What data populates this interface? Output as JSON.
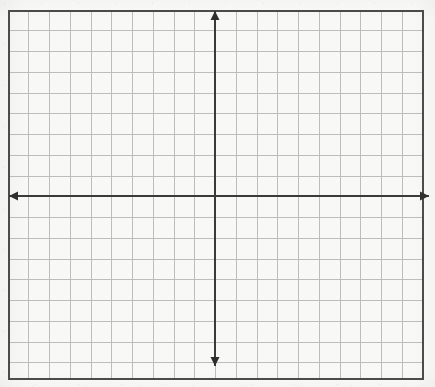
{
  "figure": {
    "type": "blank-coordinate-grid",
    "title": "",
    "width_px": 435,
    "height_px": 387
  },
  "colors": {
    "page_background": "#ffffff",
    "paper_background": "#fafaf9",
    "grid_line": "#bdbdbd",
    "grid_cell_fill": "#f8f8f7",
    "border_line": "#4a4a4a",
    "axis_line": "#3a3a3a",
    "arrow_fill": "#2e2e2e"
  },
  "frame": {
    "left_px": 8,
    "top_px": 10,
    "right_px": 424,
    "bottom_px": 380,
    "width_px": 416,
    "height_px": 370,
    "border_width_px": 2
  },
  "grid": {
    "cell_size_px": 20.75,
    "columns": 20,
    "rows": 18,
    "line_width_px": 1,
    "visible": true
  },
  "axes": {
    "x_axis": {
      "name": "x-axis",
      "orientation": "horizontal",
      "y_px": 196,
      "start_px": 9,
      "end_px": 429,
      "line_width_px": 2,
      "arrow_left": true,
      "arrow_right": true,
      "label": "",
      "tick_labels": []
    },
    "y_axis": {
      "name": "y-axis",
      "orientation": "vertical",
      "x_px": 215,
      "start_px": 11,
      "end_px": 366,
      "line_width_px": 2,
      "arrow_top": true,
      "arrow_bottom": true,
      "label": "",
      "tick_labels": []
    },
    "origin": {
      "x_px": 215,
      "y_px": 196,
      "label": ""
    }
  },
  "chart_data": {
    "type": "scatter",
    "title": "",
    "xlabel": "",
    "ylabel": "",
    "x": [],
    "y": [],
    "series": [],
    "categories": [],
    "values": [],
    "annotations": [],
    "legend": [],
    "legend_position": "none",
    "grid": true,
    "xlim": [
      -10,
      10
    ],
    "ylim": [
      -9,
      9
    ],
    "xticks": [],
    "yticks": [],
    "note": "Empty graph-paper coordinate plane; no data series plotted."
  }
}
